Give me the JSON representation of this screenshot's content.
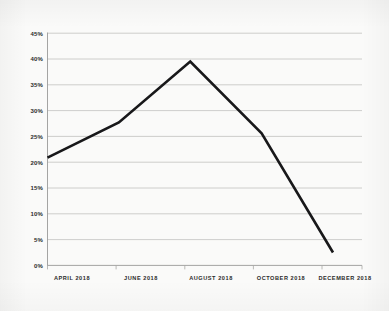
{
  "chart_data": {
    "type": "line",
    "title": "",
    "subtitle": "",
    "xlabel": "",
    "ylabel": "",
    "categories": [
      "APRIL 2018",
      "JUNE 2018",
      "AUGUST 2018",
      "OCTOBER 2018",
      "DECEMBER 2018"
    ],
    "x": [
      "APRIL 2018",
      "JUNE 2018",
      "AUGUST 2018",
      "OCTOBER 2018",
      "DECEMBER 2018"
    ],
    "values": [
      20.9,
      27.7,
      39.5,
      25.6,
      2.5
    ],
    "series": [
      {
        "name": "",
        "values": [
          20.9,
          27.7,
          39.5,
          25.6,
          2.5
        ]
      }
    ],
    "ylim": [
      0,
      45
    ],
    "ytick_values": [
      0,
      5,
      10,
      15,
      20,
      25,
      30,
      35,
      40,
      45
    ],
    "ytick_labels": [
      "0%",
      "5%",
      "10%",
      "15%",
      "20%",
      "25%",
      "30%",
      "35%",
      "40%",
      "45%"
    ],
    "xtick_labels": [
      "APRIL 2018",
      "JUNE 2018",
      "AUGUST 2018",
      "OCTOBER 2018",
      "DECEMBER 2018"
    ],
    "grid": "horizontal",
    "legend": "none",
    "annotations": [],
    "line_color": "#18181a",
    "gridline_color": "#c2c2c0",
    "axis_color": "#9a9a98",
    "background_color": "#fafaf9",
    "text_color": "#2b2b2b"
  },
  "axis": {
    "y_labels": [
      "45%",
      "40%",
      "35%",
      "30%",
      "25%",
      "20%",
      "15%",
      "10%",
      "5%",
      "0%"
    ],
    "x_labels": [
      "APRIL 2018",
      "JUNE 2018",
      "AUGUST 2018",
      "OCTOBER 2018",
      "DECEMBER 2018"
    ]
  }
}
